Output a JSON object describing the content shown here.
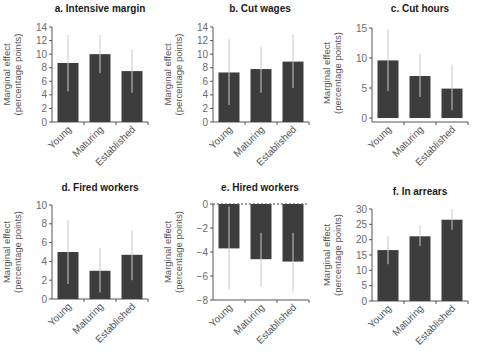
{
  "figure": {
    "colors": {
      "bar": "#3d3d3d",
      "error_bar": "#c8c8c8",
      "axis": "#444444",
      "text": "#555555"
    }
  },
  "chart_data": [
    {
      "type": "bar",
      "title": "a. Intensive margin",
      "xlabel": "",
      "ylabel": "Marginal effect (percentage points)",
      "ylabel_lines": [
        "Marginal effect",
        "(percentage points)"
      ],
      "categories": [
        "Young",
        "Maturing",
        "Established"
      ],
      "values": [
        8.7,
        10.0,
        7.5
      ],
      "ci_low": [
        4.5,
        7.2,
        4.3
      ],
      "ci_high": [
        12.8,
        12.8,
        10.7
      ],
      "ylim": [
        0,
        14
      ],
      "yticks": [
        0,
        2,
        4,
        6,
        8,
        10,
        12,
        14
      ],
      "zero_line_dashed": false,
      "grid": false
    },
    {
      "type": "bar",
      "title": "b. Cut wages",
      "xlabel": "",
      "ylabel": "Marginal effect (percentage points)",
      "ylabel_lines": [
        "Marginal effect",
        "(percentage points)"
      ],
      "categories": [
        "Young",
        "Maturing",
        "Established"
      ],
      "values": [
        7.3,
        7.8,
        8.9
      ],
      "ci_low": [
        2.5,
        4.3,
        5.0
      ],
      "ci_high": [
        12.2,
        11.1,
        12.8
      ],
      "ylim": [
        0,
        14
      ],
      "yticks": [
        0,
        2,
        4,
        6,
        8,
        10,
        12,
        14
      ],
      "zero_line_dashed": false,
      "grid": false
    },
    {
      "type": "bar",
      "title": "c. Cut hours",
      "xlabel": "",
      "ylabel": "Marginal effect (percentage points)",
      "ylabel_lines": [
        "Marginal effect",
        "(percentage points)"
      ],
      "categories": [
        "Young",
        "Maturing",
        "Established"
      ],
      "values": [
        9.6,
        7.0,
        4.9
      ],
      "ci_low": [
        4.5,
        3.5,
        1.3
      ],
      "ci_high": [
        14.8,
        10.7,
        8.9
      ],
      "ylim": [
        0,
        15
      ],
      "yticks": [
        0,
        5,
        10,
        15
      ],
      "zero_line_dashed": false,
      "grid": false
    },
    {
      "type": "bar",
      "title": "d. Fired workers",
      "xlabel": "",
      "ylabel": "Marginal effect (percentage points)",
      "ylabel_lines": [
        "Marginal effect",
        "(percentage points)"
      ],
      "categories": [
        "Young",
        "Maturing",
        "Established"
      ],
      "values": [
        5.0,
        3.0,
        4.7
      ],
      "ci_low": [
        1.6,
        0.7,
        2.0
      ],
      "ci_high": [
        8.4,
        5.4,
        7.3
      ],
      "ylim": [
        0,
        10
      ],
      "yticks": [
        0,
        2,
        4,
        6,
        8,
        10
      ],
      "zero_line_dashed": false,
      "grid": false
    },
    {
      "type": "bar",
      "title": "e. Hired workers",
      "xlabel": "",
      "ylabel": "Marginal effect (percentage points)",
      "ylabel_lines": [
        "Marginal effect",
        "(percentage points)"
      ],
      "categories": [
        "Young",
        "Maturing",
        "Established"
      ],
      "values": [
        -3.7,
        -4.6,
        -4.8
      ],
      "ci_low": [
        -7.1,
        -6.9,
        -7.3
      ],
      "ci_high": [
        -0.2,
        -2.4,
        -2.4
      ],
      "ylim": [
        -8,
        0
      ],
      "yticks": [
        -8,
        -6,
        -4,
        -2,
        0
      ],
      "ytick_labels": [
        "−8",
        "−6",
        "−4",
        "−2",
        "0"
      ],
      "zero_line_dashed": true,
      "grid": false
    },
    {
      "type": "bar",
      "title": "f. In arrears",
      "xlabel": "",
      "ylabel": "Marginal effect (percentage points)",
      "ylabel_lines": [
        "Marginal effect",
        "(percentage points)"
      ],
      "categories": [
        "Young",
        "Maturing",
        "Established"
      ],
      "values": [
        16.6,
        21.1,
        26.5
      ],
      "ci_low": [
        12.0,
        17.9,
        23.2
      ],
      "ci_high": [
        21.2,
        24.5,
        30.0
      ],
      "ylim": [
        0,
        30
      ],
      "yticks": [
        0,
        5,
        10,
        15,
        20,
        25,
        30
      ],
      "zero_line_dashed": false,
      "grid": false
    }
  ]
}
